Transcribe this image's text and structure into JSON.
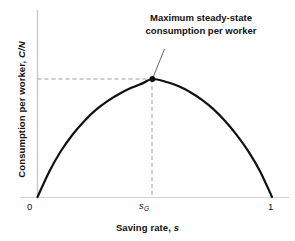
{
  "chart_data": {
    "type": "line",
    "title": "",
    "subtitle": "",
    "xlabel": "Saving rate, s",
    "xlabel_plain": "Saving rate,",
    "xlabel_italic": "s",
    "ylabel": "Consumption per worker, C/N",
    "ylabel_plain": "Consumption per worker,",
    "ylabel_italic": "C/N",
    "xlim": [
      0,
      1
    ],
    "ylim": [
      0,
      1
    ],
    "grid": false,
    "legend": "none",
    "x_ticks": [
      {
        "value": 0,
        "label": "0"
      },
      {
        "value": 0.49,
        "label": "sG",
        "label_base": "s",
        "label_sub": "G",
        "italic": true
      },
      {
        "value": 1,
        "label": "1"
      }
    ],
    "y_ticks": [],
    "series": [
      {
        "name": "Steady-state consumption per worker",
        "description": "Hump-shaped curve: consumption per worker as a function of the saving rate, zero at s=0 and s=1, maximized at the golden-rule saving rate s_G.",
        "x": [
          0.0,
          0.05,
          0.1,
          0.15,
          0.2,
          0.25,
          0.3,
          0.35,
          0.4,
          0.45,
          0.49,
          0.55,
          0.6,
          0.65,
          0.7,
          0.75,
          0.8,
          0.85,
          0.9,
          0.95,
          1.0
        ],
        "y": [
          0.0,
          0.215,
          0.39,
          0.53,
          0.645,
          0.74,
          0.815,
          0.875,
          0.925,
          0.965,
          1.0,
          0.975,
          0.94,
          0.89,
          0.825,
          0.745,
          0.645,
          0.525,
          0.385,
          0.215,
          0.0
        ],
        "color": "#111111",
        "line_width": 2.2
      }
    ],
    "annotations": [
      {
        "name": "max-consumption-callout",
        "text_lines": [
          "Maximum steady-state",
          "consumption per worker"
        ],
        "points_to_x": 0.49,
        "points_to_y": 1.0
      }
    ],
    "markers": [
      {
        "name": "golden-rule-point",
        "x": 0.49,
        "y": 1.0,
        "style": "filled-circle",
        "color": "#111111"
      }
    ],
    "guide_lines": [
      {
        "name": "horizontal-guide",
        "orientation": "horizontal",
        "y": 1.0,
        "from_x": 0,
        "to_x": 0.49,
        "style": "dashed",
        "color": "#9a9a9a"
      },
      {
        "name": "vertical-guide",
        "orientation": "vertical",
        "x": 0.49,
        "from_y": 0,
        "to_y": 1.0,
        "style": "dashed",
        "color": "#9a9a9a"
      }
    ],
    "colors": {
      "curve": "#111111",
      "axis": "#c8c8c8",
      "baseline": "#d4d4d4",
      "guide": "#9a9a9a",
      "text": "#111111",
      "background": "#ffffff"
    }
  },
  "annotation": {
    "line1": "Maximum steady-state",
    "line2": "consumption per worker"
  },
  "axes": {
    "y_label_plain": "Consumption per worker,",
    "y_label_italic": "C/N",
    "x_label_plain": "Saving rate,",
    "x_label_italic": "s"
  },
  "ticks": {
    "x_zero": "0",
    "x_one": "1",
    "x_sg_base": "s",
    "x_sg_sub": "G"
  }
}
